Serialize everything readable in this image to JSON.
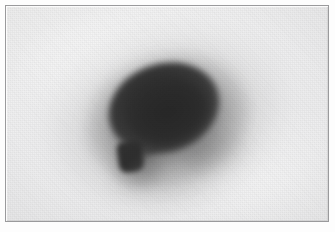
{
  "image": {
    "kind": "grayscale-scan-photograph",
    "caption": "",
    "modality_hint": "scintigram / autoradiograph style grayscale plate",
    "width_px": 335,
    "height_px": 232,
    "orientation": "landscape"
  },
  "frame": {
    "border_color": "#9a9a9c",
    "border_width_px": 1,
    "outer_margin_color": "#fdfdfd",
    "outer_margin_px": 5,
    "plate_width_px": 324,
    "plate_height_px": 217
  },
  "palette": {
    "background_light": "#efeff0",
    "background_mottle": "#f3f3f3",
    "mass_core_darkest": "#272727",
    "mass_core": "#2b2b2b",
    "mass_edge": "#555555",
    "halo_mid": "#5a5a5a",
    "appendage_core": "#2e2e2e",
    "paper_white": "#fdfdfd"
  },
  "features": [
    {
      "name": "main-mass",
      "label": "Large dense oval mass",
      "shape": "ellipse",
      "center_px": [
        164,
        108
      ],
      "width_px": 112,
      "height_px": 88,
      "rotation_deg": -18,
      "intensity": "very dark / near black",
      "edge": "soft blurred gradient halo"
    },
    {
      "name": "appendage",
      "label": "Small rounded-rectangular appendage",
      "shape": "rounded-rectangle",
      "center_px": [
        130,
        156
      ],
      "width_px": 25,
      "height_px": 31,
      "rotation_deg": -8,
      "intensity": "dark",
      "position_relative": "lower-left of main mass"
    },
    {
      "name": "neck",
      "label": "Narrow connecting neck",
      "shape": "bridge",
      "center_px": [
        139,
        139
      ],
      "rotation_deg": -34,
      "intensity": "dark, tapering"
    },
    {
      "name": "halo",
      "label": "Diffuse grey halo surrounding mass",
      "shape": "ellipse",
      "center_px": [
        166,
        116
      ],
      "width_px": 240,
      "height_px": 180,
      "rotation_deg": -16,
      "intensity": "faint grey falloff"
    },
    {
      "name": "smear",
      "label": "Faint smear trailing lower-right",
      "shape": "ellipse",
      "center_px": [
        213,
        150
      ],
      "intensity": "very faint grey"
    }
  ],
  "annotations": {
    "text_labels": [],
    "scale_bar": null,
    "arrows": []
  }
}
